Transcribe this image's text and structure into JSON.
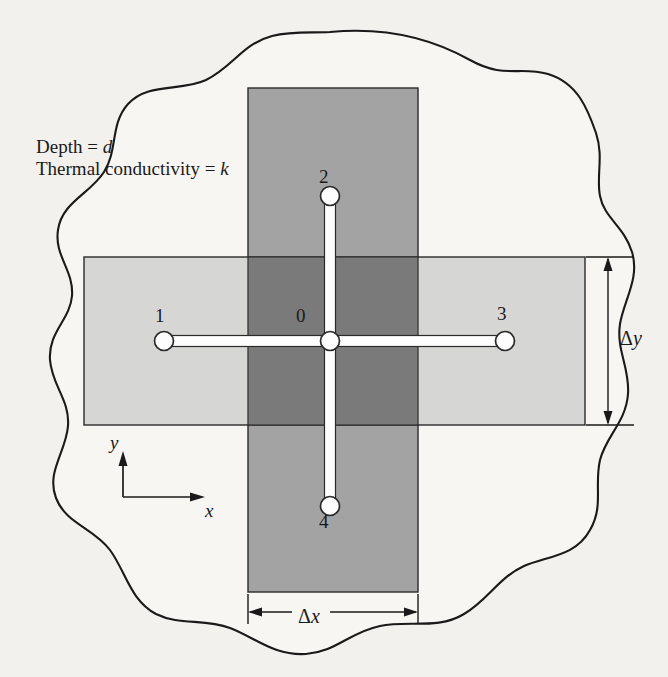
{
  "figure": {
    "kind": "heat-conduction-finite-difference-control-volume",
    "background_color": "#f3f1ed",
    "outline_color": "#1a1a1a"
  },
  "annotations": {
    "depth_label": "Depth = ",
    "depth_symbol": "d",
    "conductivity_label": "Thermal conductivity = ",
    "conductivity_symbol": "k"
  },
  "nodes": [
    {
      "id": "0",
      "label": "0",
      "role": "center-node",
      "x": 330,
      "y": 341
    },
    {
      "id": "1",
      "label": "1",
      "role": "west-node",
      "x": 164,
      "y": 341
    },
    {
      "id": "2",
      "label": "2",
      "role": "north-node",
      "x": 330,
      "y": 196
    },
    {
      "id": "3",
      "label": "3",
      "role": "east-node",
      "x": 505,
      "y": 341
    },
    {
      "id": "4",
      "label": "4",
      "role": "south-node",
      "x": 330,
      "y": 506
    }
  ],
  "dimensions": {
    "delta_x": {
      "symbol": "Δ",
      "variable": "x",
      "orientation": "horizontal"
    },
    "delta_y": {
      "symbol": "Δ",
      "variable": "y",
      "orientation": "vertical"
    }
  },
  "axes": {
    "x_label": "x",
    "y_label": "y"
  },
  "regions": {
    "vertical_band": {
      "name": "vertical-control-volume",
      "color": "#a3a3a3",
      "x": 248,
      "y": 88,
      "w": 170,
      "h": 504
    },
    "horizontal_band": {
      "name": "horizontal-control-volume",
      "color": "#cecece",
      "x": 84,
      "y": 257,
      "w": 501,
      "h": 168
    },
    "overlap": {
      "name": "control-volume-overlap",
      "color": "#7a7a7a",
      "x": 248,
      "y": 257,
      "w": 170,
      "h": 168
    }
  },
  "connectors": {
    "color": "#ffffff",
    "border_color": "#2a2a2a",
    "node_fill": "#fdfdfd"
  }
}
